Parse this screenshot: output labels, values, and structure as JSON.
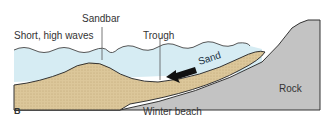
{
  "diagram": {
    "panel_letter": "B",
    "caption": "Winter beach",
    "labels": {
      "waves": "Short, high waves",
      "sandbar": "Sandbar",
      "trough": "Trough",
      "sand": "Sand",
      "rock": "Rock"
    },
    "colors": {
      "water": "#d6ecf3",
      "sand": "#dcc79a",
      "rock": "#c3c3c3",
      "outline": "#333333",
      "arrow": "#111111"
    }
  }
}
